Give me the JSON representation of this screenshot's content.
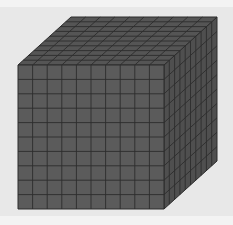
{
  "figure": {
    "grid": {
      "rows": 10,
      "cols": 10,
      "depth": 10
    },
    "geometry": {
      "front": {
        "x1": 18,
        "y1": 65,
        "x2": 164,
        "y2": 209
      },
      "offset": {
        "dx": 53,
        "dy": -48
      }
    },
    "colors": {
      "front_face": "#5b5b5b",
      "top_face": "#555555",
      "side_face": "#4f4f4f",
      "grid_line": "#2c2c2c",
      "background": "#e8e8e8",
      "band": "#f3f3f3"
    }
  }
}
